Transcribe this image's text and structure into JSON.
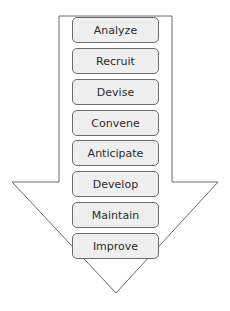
{
  "diagram": {
    "type": "downward-arrow-process",
    "arrow": {
      "stroke": "#6b6b6b",
      "fill": "#ffffff"
    },
    "steps": [
      {
        "label": "Analyze"
      },
      {
        "label": "Recruit"
      },
      {
        "label": "Devise"
      },
      {
        "label": "Convene"
      },
      {
        "label": "Anticipate"
      },
      {
        "label": "Develop"
      },
      {
        "label": "Maintain"
      },
      {
        "label": "Improve"
      }
    ]
  }
}
